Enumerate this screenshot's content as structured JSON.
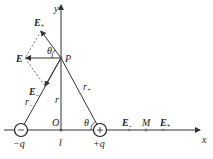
{
  "diagram": {
    "axes": {
      "x_label": "x",
      "y_label": "y",
      "origin_label": "O"
    },
    "points": {
      "P": "P",
      "M": "M"
    },
    "charges": {
      "negative": "−q",
      "positive": "+q"
    },
    "distances": {
      "r": "r",
      "r_minus": "r",
      "r_plus": "r",
      "l": "l",
      "minus_sub": "−",
      "plus_sub": "+"
    },
    "angles": {
      "theta_top": "θ",
      "theta_bottom": "θ"
    },
    "fields": {
      "E": "E",
      "E_minus_top": "E",
      "E_minus_lower": "E",
      "E_minus_axis": "E",
      "E_plus_axis": "E",
      "minus_sub": "−",
      "plus_sub": "+"
    },
    "colors": {
      "line": "#333333",
      "dashed": "#555555",
      "charge_circle": "#222222"
    }
  }
}
